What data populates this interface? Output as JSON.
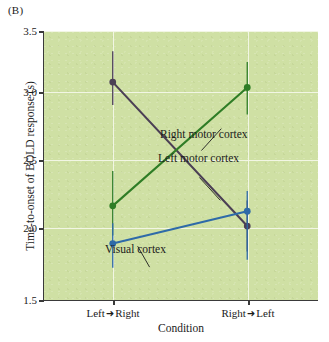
{
  "panel": {
    "label": "(B)"
  },
  "chart_data": {
    "type": "line",
    "title": "",
    "subtitle": "",
    "xlabel": "Condition",
    "ylabel": "Time-to-onset of BOLD response (s)",
    "categories": [
      "Left → Right",
      "Right → Left"
    ],
    "category_parts": [
      {
        "from": "Left",
        "arrow": "➜",
        "to": "Right"
      },
      {
        "from": "Right",
        "arrow": "➜",
        "to": "Left"
      }
    ],
    "ylim": [
      1.5,
      3.5
    ],
    "yticks": [
      1.5,
      2.0,
      2.5,
      3.0,
      3.5
    ],
    "ytick_labels": [
      "1.5",
      "2.0",
      "2.5",
      "3.0",
      "3.5"
    ],
    "grid": "white horizontal and vertical gridlines",
    "legend": "inline annotations with leader lines",
    "plot_background": "#cfe0a4",
    "series": [
      {
        "name": "Left motor cortex",
        "color": "#4b3f55",
        "values": [
          3.12,
          2.05
        ],
        "errors_low": [
          2.95,
          1.86
        ],
        "errors_high": [
          3.35,
          2.24
        ]
      },
      {
        "name": "Right motor cortex",
        "color": "#2f7d26",
        "values": [
          2.2,
          3.08
        ],
        "errors_low": [
          1.98,
          2.88
        ],
        "errors_high": [
          2.46,
          3.27
        ]
      },
      {
        "name": "Visual cortex",
        "color": "#2e6aa8",
        "values": [
          1.92,
          2.16
        ],
        "errors_low": [
          1.74,
          1.8
        ],
        "errors_high": [
          2.07,
          2.31
        ]
      }
    ],
    "annotations": [
      {
        "text": "Right motor cortex",
        "target_series": "Right motor cortex"
      },
      {
        "text": "Left motor cortex",
        "target_series": "Left motor cortex"
      },
      {
        "text": "Visual cortex",
        "target_series": "Visual cortex"
      }
    ]
  }
}
